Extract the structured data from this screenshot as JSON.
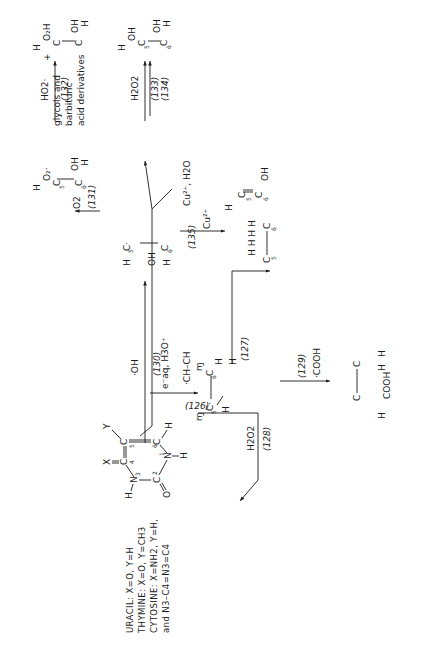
{
  "diagram": {
    "type": "reaction-scheme",
    "orientation": "rotated-90-ccw",
    "legend": [
      "URACIL: X=O, Y=H",
      "THYMINE: X=O, Y=CH3",
      "CYTOSINE: X=NH2, Y=H,",
      "and N3–C4=N3=C4"
    ],
    "start_compound": {
      "label": "pyrimidine base",
      "atoms": [
        "N3",
        "C4",
        "C5",
        "C6",
        "N1",
        "C2"
      ],
      "substituents": {
        "C4": "X",
        "C5": "Y",
        "C6": "H",
        "N1": "H",
        "N3": "H",
        "C2": "O"
      }
    },
    "reactions": [
      {
        "number": "(126)",
        "reagent": "e⁻aq, H3O⁺",
        "product": "5-yl radical (·C5H–C6H2)"
      },
      {
        "number": "(127)",
        "reagent": "·H",
        "product": "5,6-dihydro (C5H2–C6H2)"
      },
      {
        "number": "(128)",
        "reagent": "H2O2",
        "product": "back to parent base"
      },
      {
        "number": "(129)",
        "reagent": "·COOH",
        "product": "C5(H)(COOH)–C6(H)(H)"
      },
      {
        "number": "(130)",
        "reagent": "·OH",
        "product": "6-hydroxy-5-yl radical"
      },
      {
        "number": "(131)",
        "reagent": "O2",
        "product": "5-peroxyl radical (C5H–O2·, C6H–OH)"
      },
      {
        "number": "(132)",
        "reagent": "HO2·",
        "product": "5-hydroperoxide (C5H–O2H, C6H–OH)"
      },
      {
        "number": "(133)",
        "reagent": "H2O2",
        "product": "5,6-glycol (C5H–OH, C6H–OH)"
      },
      {
        "number": "(134)",
        "reagent": "",
        "product": "C(H)(OH)–C(H)(H)"
      },
      {
        "number": "(135)",
        "reagent": "Cu²⁺",
        "product": "enol (C5H=C6–OH)"
      }
    ],
    "side_labels": {
      "dimer": "·CH–CH",
      "copper_water": "Cu²⁺, H2O",
      "copper": "Cu²⁺",
      "plus": "+",
      "byproducts": [
        "glycols and",
        "barbituric",
        "acid derivatives"
      ]
    }
  }
}
